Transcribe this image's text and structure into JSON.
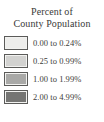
{
  "legend": {
    "title_line_1": "Percent of",
    "title_line_2": "County Population",
    "title_color": "#3a3a38",
    "background_color": "#ffffff",
    "swatch_border_color": "#5b5b59",
    "items": [
      {
        "label": "0.00 to 0.24%",
        "color": "#ededeb",
        "range_min": 0.0,
        "range_max": 0.24
      },
      {
        "label": "0.25 to 0.99%",
        "color": "#d2d2d0",
        "range_min": 0.25,
        "range_max": 0.99
      },
      {
        "label": "1.00 to 1.99%",
        "color": "#a9a9a7",
        "range_min": 1.0,
        "range_max": 1.99
      },
      {
        "label": "2.00 to 4.99%",
        "color": "#757573",
        "range_min": 2.0,
        "range_max": 4.99
      }
    ]
  }
}
